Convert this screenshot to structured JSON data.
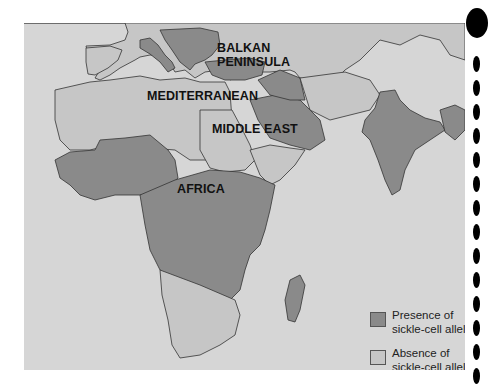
{
  "map": {
    "title": "Distribution of sickle-cell allele",
    "region_labels": [
      {
        "id": "balkan-peninsula-line1",
        "text": "BALKAN"
      },
      {
        "id": "balkan-peninsula-line2",
        "text": "PENINSULA"
      },
      {
        "id": "mediterranean",
        "text": "MEDITERRANEAN"
      },
      {
        "id": "middle-east",
        "text": "MIDDLE EAST"
      },
      {
        "id": "africa",
        "text": "AFRICA"
      }
    ],
    "colors": {
      "ocean": "#d6d6d6",
      "presence": "#8a8a8a",
      "absence": "#c6c6c6",
      "border": "#333333"
    }
  },
  "legend": {
    "items": [
      {
        "line1": "Presence of",
        "line2": "sickle-cell allele",
        "color": "#8a8a8a"
      },
      {
        "line1": "Absence of",
        "line2": "sickle-cell allele",
        "color": "#c6c6c6"
      }
    ]
  }
}
